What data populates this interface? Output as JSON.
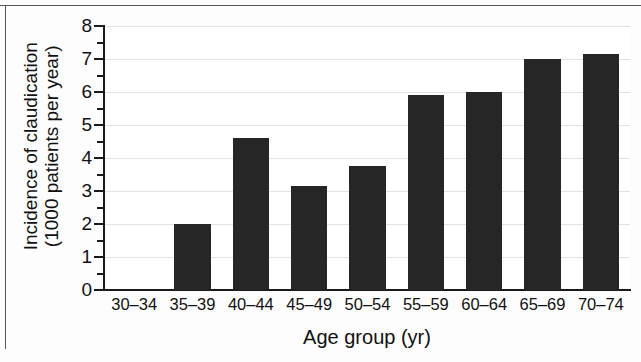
{
  "chart_data": {
    "type": "bar",
    "title": "",
    "subtitle": "",
    "xlabel": "Age group (yr)",
    "ylabel_line1": "Incidence of claudication",
    "ylabel_line2": "(1000 patients per year)",
    "ylabel": "Incidence of claudication (1000 patients per year)",
    "categories": [
      "30–34",
      "35–39",
      "40–44",
      "45–49",
      "50–54",
      "55–59",
      "60–64",
      "65–69",
      "70–74"
    ],
    "values": [
      0,
      2.0,
      4.6,
      3.15,
      3.75,
      5.9,
      6.0,
      7.0,
      7.15
    ],
    "ylim": [
      0,
      8
    ],
    "ytick_labels": [
      "0",
      "1",
      "2",
      "3",
      "4",
      "5",
      "6",
      "7",
      "8"
    ],
    "ytick_values": [
      0,
      1,
      2,
      3,
      4,
      5,
      6,
      7,
      8
    ],
    "yminor_values": [
      0.5,
      1.5,
      2.5,
      3.5,
      4.5,
      5.5,
      6.5,
      7.5
    ],
    "grid": "horizontal",
    "legend": "none",
    "bar_color": "#262626",
    "axis_color": "#1a1a1a",
    "grid_color": "#e2e2e2",
    "background_color": "#ffffff"
  }
}
